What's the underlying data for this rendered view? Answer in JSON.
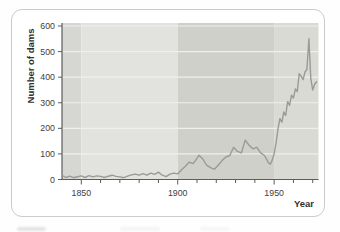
{
  "figure": {
    "type_hint": "textbook-style framed line chart",
    "frame_border_color": "#cbcbc8",
    "frame_background": "#ffffff"
  },
  "chart_data": {
    "type": "line",
    "title": "",
    "xlabel": "Year",
    "ylabel": "Number of dams",
    "xlim": [
      1840,
      1973
    ],
    "ylim": [
      0,
      600
    ],
    "xticks_major": [
      1850,
      1900,
      1950
    ],
    "xticks_minor": [
      1860,
      1870,
      1880,
      1890,
      1910,
      1920,
      1930,
      1940,
      1960,
      1970
    ],
    "yticks": [
      0,
      100,
      200,
      300,
      400,
      500,
      600
    ],
    "grid": "horizontal white gridlines at each 100",
    "legend": "none",
    "line_color": "#9a9a96",
    "bands": [
      {
        "from": 1840,
        "to": 1850,
        "color": "#d6d7d2"
      },
      {
        "from": 1850,
        "to": 1900,
        "color": "#e2e3de"
      },
      {
        "from": 1900,
        "to": 1950,
        "color": "#cfd0ca"
      },
      {
        "from": 1950,
        "to": 1973,
        "color": "#d9dad4"
      }
    ],
    "series": [
      {
        "name": "dams-built",
        "points": [
          [
            1840,
            16
          ],
          [
            1842,
            8
          ],
          [
            1844,
            13
          ],
          [
            1846,
            7
          ],
          [
            1848,
            11
          ],
          [
            1850,
            14
          ],
          [
            1852,
            8
          ],
          [
            1854,
            15
          ],
          [
            1856,
            10
          ],
          [
            1858,
            14
          ],
          [
            1860,
            12
          ],
          [
            1862,
            8
          ],
          [
            1864,
            13
          ],
          [
            1866,
            17
          ],
          [
            1868,
            12
          ],
          [
            1870,
            10
          ],
          [
            1872,
            7
          ],
          [
            1874,
            13
          ],
          [
            1876,
            18
          ],
          [
            1878,
            21
          ],
          [
            1880,
            17
          ],
          [
            1882,
            23
          ],
          [
            1884,
            17
          ],
          [
            1886,
            25
          ],
          [
            1888,
            20
          ],
          [
            1890,
            29
          ],
          [
            1892,
            17
          ],
          [
            1894,
            11
          ],
          [
            1896,
            21
          ],
          [
            1898,
            25
          ],
          [
            1900,
            22
          ],
          [
            1902,
            38
          ],
          [
            1904,
            52
          ],
          [
            1906,
            68
          ],
          [
            1908,
            62
          ],
          [
            1910,
            83
          ],
          [
            1911,
            95
          ],
          [
            1913,
            80
          ],
          [
            1915,
            56
          ],
          [
            1917,
            46
          ],
          [
            1919,
            40
          ],
          [
            1921,
            56
          ],
          [
            1923,
            74
          ],
          [
            1925,
            88
          ],
          [
            1927,
            94
          ],
          [
            1929,
            126
          ],
          [
            1931,
            110
          ],
          [
            1933,
            104
          ],
          [
            1935,
            154
          ],
          [
            1937,
            134
          ],
          [
            1939,
            120
          ],
          [
            1941,
            126
          ],
          [
            1943,
            104
          ],
          [
            1945,
            94
          ],
          [
            1947,
            66
          ],
          [
            1948,
            60
          ],
          [
            1949,
            76
          ],
          [
            1950,
            100
          ],
          [
            1951,
            144
          ],
          [
            1952,
            198
          ],
          [
            1953,
            238
          ],
          [
            1954,
            224
          ],
          [
            1955,
            264
          ],
          [
            1956,
            250
          ],
          [
            1957,
            304
          ],
          [
            1958,
            290
          ],
          [
            1959,
            330
          ],
          [
            1960,
            318
          ],
          [
            1961,
            354
          ],
          [
            1962,
            344
          ],
          [
            1963,
            414
          ],
          [
            1964,
            404
          ],
          [
            1965,
            390
          ],
          [
            1966,
            420
          ],
          [
            1967,
            430
          ],
          [
            1968,
            550
          ],
          [
            1969,
            395
          ],
          [
            1970,
            350
          ],
          [
            1971,
            372
          ],
          [
            1972,
            382
          ]
        ]
      }
    ]
  },
  "colors": {
    "axis": "#5c5c5c",
    "gridline": "#efefeb",
    "tick_text": "#3e3e3e",
    "title_text": "#2f2f2f"
  }
}
